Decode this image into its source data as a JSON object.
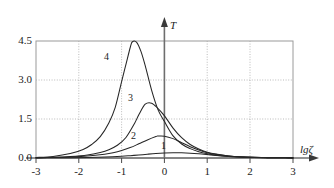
{
  "chart_data": {
    "type": "line",
    "title": "",
    "subtitle": "",
    "xlabel": "lgζ",
    "ylabel": "T",
    "xlim": [
      -3,
      3
    ],
    "ylim": [
      0.0,
      4.5
    ],
    "grid": true,
    "grid_style": "dotted",
    "legend": "inline-curve-numbers",
    "x_ticks": [
      "-3",
      "-2",
      "-1",
      "0",
      "1",
      "2",
      "3"
    ],
    "x_tick_values": [
      -3,
      -2,
      -1,
      0,
      1,
      2,
      3
    ],
    "y_ticks": [
      "0.0",
      "1.5",
      "3.0",
      "4.5"
    ],
    "y_tick_values": [
      0.0,
      1.5,
      3.0,
      4.5
    ],
    "annotations": [
      {
        "text": "4",
        "x": -1.12,
        "y": 3.45
      },
      {
        "text": "3",
        "x": -0.78,
        "y": 2.22
      },
      {
        "text": "2",
        "x": -0.55,
        "y": 0.82
      },
      {
        "text": "1",
        "x": -0.05,
        "y": 0.53
      }
    ],
    "series": [
      {
        "name": "1",
        "peak_x": 0.2,
        "peak_y": 0.2,
        "x": [
          -3.0,
          -2.6,
          -2.2,
          -1.8,
          -1.4,
          -1.0,
          -0.8,
          -0.6,
          -0.4,
          -0.2,
          0.0,
          0.2,
          0.4,
          0.6,
          0.8,
          1.0,
          1.2,
          1.5,
          1.8,
          2.1,
          2.4,
          2.7,
          3.0
        ],
        "values": [
          0.005,
          0.008,
          0.013,
          0.022,
          0.038,
          0.068,
          0.09,
          0.115,
          0.145,
          0.172,
          0.19,
          0.2,
          0.198,
          0.185,
          0.162,
          0.132,
          0.1,
          0.062,
          0.037,
          0.022,
          0.013,
          0.008,
          0.005
        ]
      },
      {
        "name": "2",
        "peak_x": -0.15,
        "peak_y": 0.85,
        "x": [
          -3.0,
          -2.6,
          -2.2,
          -1.8,
          -1.4,
          -1.2,
          -1.0,
          -0.8,
          -0.6,
          -0.4,
          -0.2,
          -0.15,
          0.0,
          0.2,
          0.4,
          0.6,
          0.8,
          1.0,
          1.2,
          1.5,
          1.8,
          2.1,
          2.4,
          2.7,
          3.0
        ],
        "values": [
          0.01,
          0.02,
          0.04,
          0.075,
          0.145,
          0.2,
          0.285,
          0.4,
          0.545,
          0.695,
          0.825,
          0.845,
          0.84,
          0.745,
          0.59,
          0.435,
          0.305,
          0.205,
          0.14,
          0.075,
          0.042,
          0.024,
          0.014,
          0.008,
          0.005
        ]
      },
      {
        "name": "3",
        "peak_x": -0.45,
        "peak_y": 2.12,
        "x": [
          -3.0,
          -2.6,
          -2.2,
          -1.8,
          -1.5,
          -1.3,
          -1.1,
          -0.9,
          -0.7,
          -0.6,
          -0.45,
          -0.3,
          -0.15,
          0.0,
          0.2,
          0.4,
          0.6,
          0.8,
          1.0,
          1.2,
          1.5,
          1.8,
          2.1,
          2.4,
          2.7,
          3.0
        ],
        "values": [
          0.012,
          0.025,
          0.055,
          0.115,
          0.215,
          0.32,
          0.49,
          0.79,
          1.33,
          1.66,
          2.07,
          2.11,
          1.9,
          1.62,
          1.15,
          0.78,
          0.52,
          0.345,
          0.225,
          0.15,
          0.08,
          0.045,
          0.025,
          0.015,
          0.009,
          0.005
        ]
      },
      {
        "name": "4",
        "peak_x": -0.75,
        "peak_y": 4.5,
        "x": [
          -3.0,
          -2.6,
          -2.2,
          -1.9,
          -1.7,
          -1.5,
          -1.3,
          -1.15,
          -1.0,
          -0.9,
          -0.8,
          -0.75,
          -0.65,
          -0.55,
          -0.45,
          -0.3,
          -0.15,
          0.0,
          0.2,
          0.4,
          0.6,
          0.8,
          1.0,
          1.2,
          1.5,
          1.8,
          2.1,
          2.4,
          2.7,
          3.0
        ],
        "values": [
          0.02,
          0.06,
          0.17,
          0.33,
          0.52,
          0.82,
          1.35,
          1.95,
          2.95,
          3.6,
          4.25,
          4.47,
          4.45,
          4.1,
          3.55,
          2.6,
          1.85,
          1.4,
          0.85,
          0.54,
          0.36,
          0.24,
          0.16,
          0.105,
          0.055,
          0.032,
          0.018,
          0.011,
          0.007,
          0.004
        ]
      }
    ]
  },
  "axes": {
    "y_axis_symbol": "T",
    "x_axis_symbol": "lgζ"
  }
}
